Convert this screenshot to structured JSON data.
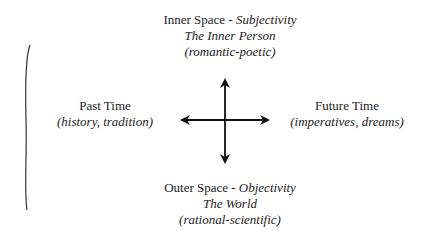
{
  "top": {
    "title": "Inner Space - ",
    "title_italic": "Subjectivity",
    "line2": "The Inner Person",
    "line3": "(romantic-poetic)"
  },
  "bottom": {
    "title": "Outer Space - ",
    "title_italic": "Objectivity",
    "line2": "The World",
    "line3": "(rational-scientific)"
  },
  "left": {
    "title": "Past Time",
    "subtitle": "(history, tradition)"
  },
  "right": {
    "title": "Future Time",
    "subtitle": "(imperatives, dreams)"
  },
  "colors": {
    "ink": "#222222",
    "background": "#ffffff"
  }
}
